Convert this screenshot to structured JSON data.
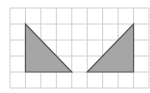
{
  "diagram": {
    "type": "grid-with-shapes",
    "grid": {
      "columns": 9,
      "rows": 5,
      "line_color": "#d0d0d0",
      "background": "#ffffff"
    },
    "shapes": [
      {
        "name": "left-triangle",
        "vertices_grid": [
          [
            1,
            1
          ],
          [
            1,
            4
          ],
          [
            4,
            4
          ]
        ],
        "fill": "#a6a6a6",
        "stroke": "#555555"
      },
      {
        "name": "right-triangle",
        "vertices_grid": [
          [
            5,
            4
          ],
          [
            8,
            4
          ],
          [
            8,
            1
          ]
        ],
        "fill": "#a6a6a6",
        "stroke": "#555555"
      }
    ]
  }
}
